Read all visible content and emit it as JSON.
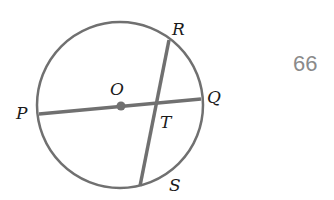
{
  "figure": {
    "number": "66",
    "colors": {
      "stroke": "#707070",
      "label": "#1a1a1a",
      "number": "#8a8a8a",
      "background": "#ffffff"
    },
    "circle": {
      "center_label": "O",
      "cx": 120,
      "cy": 105,
      "r": 83
    },
    "points": {
      "P": {
        "label": "P",
        "x": 39,
        "y": 114
      },
      "Q": {
        "label": "Q",
        "x": 201,
        "y": 99
      },
      "R": {
        "label": "R",
        "x": 169,
        "y": 40
      },
      "S": {
        "label": "S",
        "x": 140,
        "y": 186
      },
      "O": {
        "label": "O",
        "x": 121,
        "y": 106
      },
      "T": {
        "label": "T",
        "x": 155,
        "y": 103
      }
    },
    "segments": [
      {
        "name": "diameter-PQ",
        "from": "P",
        "to": "Q"
      },
      {
        "name": "chord-RS",
        "from": "R",
        "to": "S"
      }
    ]
  }
}
